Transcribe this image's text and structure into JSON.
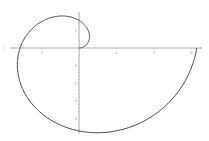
{
  "chart_data": {
    "type": "line",
    "title": "",
    "xlabel": "",
    "ylabel": "",
    "param_range": [
      0,
      6.2832
    ],
    "xlim": [
      -4.1,
      6.8
    ],
    "ylim": [
      -5.0,
      2.5
    ],
    "x_ticks": [
      -2,
      2,
      4,
      6
    ],
    "x_tick_labels": [
      "-2",
      "2",
      "4",
      "6"
    ],
    "y_ticks": [
      1,
      -1,
      -2,
      -3,
      -4
    ],
    "y_tick_labels": [
      "1",
      "-1",
      "-2",
      "-3",
      "-4"
    ],
    "grid": false,
    "legend": null,
    "series": [
      {
        "name": "spiral",
        "color": "#333333",
        "key_points": [
          {
            "t": 0,
            "x": 0,
            "y": 0
          },
          {
            "t": 1.5708,
            "x": 0,
            "y": 1.571
          },
          {
            "t": 3.1416,
            "x": -3.142,
            "y": 0
          },
          {
            "t": 4.7124,
            "x": 0,
            "y": -4.712
          },
          {
            "t": 6.2832,
            "x": 6.283,
            "y": 0
          }
        ]
      }
    ]
  }
}
